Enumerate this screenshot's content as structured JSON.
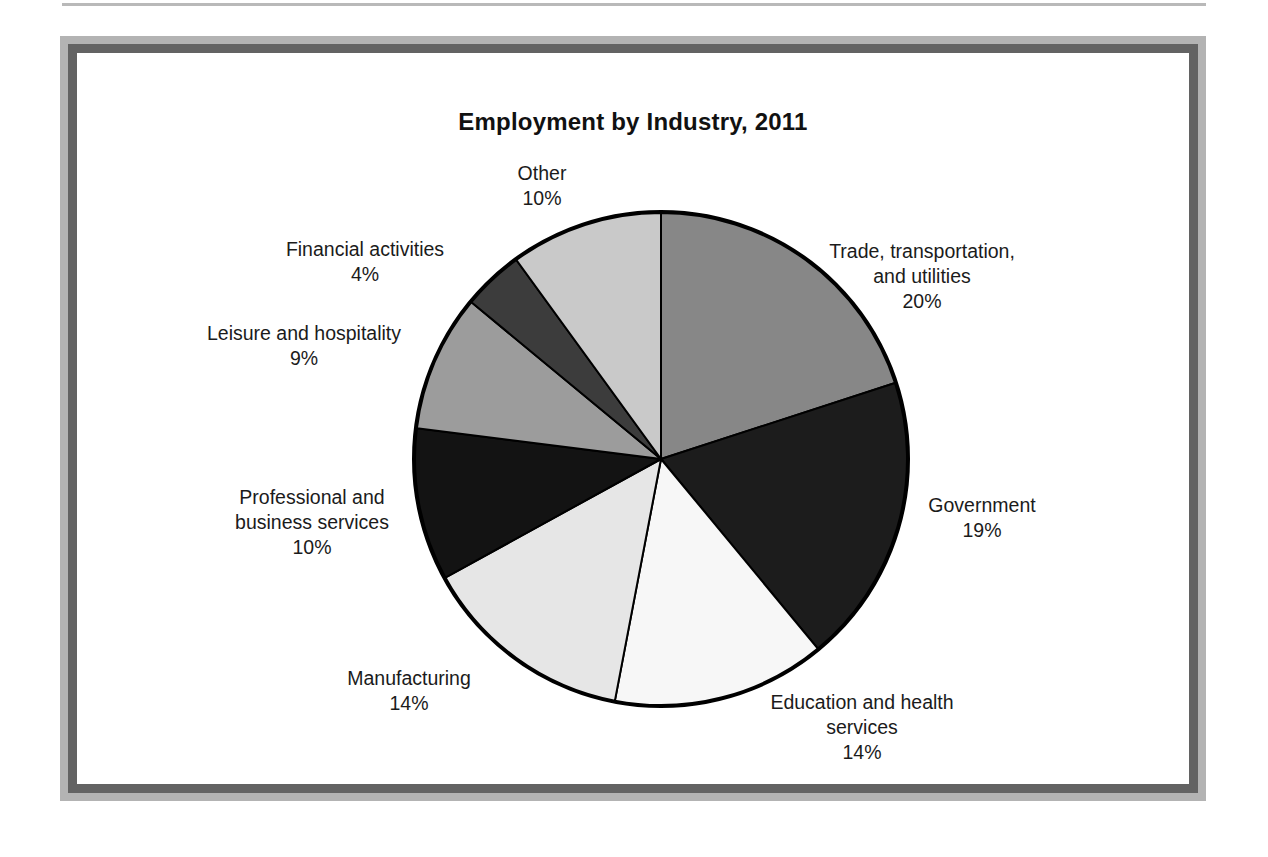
{
  "figure": {
    "title": "Employment by Industry, 2011"
  },
  "chart_data": {
    "type": "pie",
    "title": "Employment by Industry, 2011",
    "xlabel": "",
    "ylabel": "",
    "units": "percent",
    "start_angle_deg": 0,
    "direction": "clockwise",
    "legend": "none (labels placed outside slices)",
    "grid": false,
    "categories": [
      "Trade, transportation, and utilities",
      "Government",
      "Education and health services",
      "Manufacturing",
      "Professional and business services",
      "Leisure and hospitality",
      "Financial activities",
      "Other"
    ],
    "values": [
      20,
      19,
      14,
      14,
      10,
      9,
      4,
      10
    ],
    "value_labels": [
      "20%",
      "19%",
      "14%",
      "14%",
      "10%",
      "9%",
      "4%",
      "10%"
    ],
    "colors": [
      "#878787",
      "#1c1c1c",
      "#f7f7f7",
      "#e6e6e6",
      "#131313",
      "#9c9c9c",
      "#3c3c3c",
      "#c9c9c9"
    ],
    "slices": [
      {
        "name": "Trade, transportation, and utilities",
        "label_lines": "Trade, transportation,\nand utilities\n20%",
        "value": 20,
        "value_label": "20%",
        "color": "#878787"
      },
      {
        "name": "Government",
        "label_lines": "Government\n19%",
        "value": 19,
        "value_label": "19%",
        "color": "#1c1c1c"
      },
      {
        "name": "Education and health services",
        "label_lines": "Education and health\nservices\n14%",
        "value": 14,
        "value_label": "14%",
        "color": "#f7f7f7"
      },
      {
        "name": "Manufacturing",
        "label_lines": "Manufacturing\n14%",
        "value": 14,
        "value_label": "14%",
        "color": "#e6e6e6"
      },
      {
        "name": "Professional and business services",
        "label_lines": "Professional and\nbusiness services\n10%",
        "value": 10,
        "value_label": "10%",
        "color": "#131313"
      },
      {
        "name": "Leisure and hospitality",
        "label_lines": "Leisure and hospitality\n9%",
        "value": 9,
        "value_label": "9%",
        "color": "#9c9c9c"
      },
      {
        "name": "Financial activities",
        "label_lines": "Financial activities\n4%",
        "value": 4,
        "value_label": "4%",
        "color": "#3c3c3c"
      },
      {
        "name": "Other",
        "label_lines": "Other\n10%",
        "value": 10,
        "value_label": "10%",
        "color": "#c9c9c9"
      }
    ]
  },
  "style": {
    "frame_outer_color": "#b3b3b3",
    "frame_inner_color": "#636363",
    "canvas_color": "#ffffff",
    "slice_outline_color": "#000000",
    "text_color": "#1b1b1b"
  }
}
